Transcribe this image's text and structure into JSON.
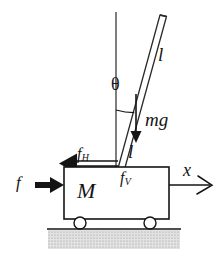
{
  "figure": {
    "background_color": "#ffffff",
    "ink_color": "#141414",
    "ground_fill_color": "#d4d4d4"
  },
  "labels": {
    "pendulum_length_upper": "l",
    "angle": "θ",
    "gravity_force": "mg",
    "pendulum_length_lower": "l",
    "horizontal_reaction_force": "f",
    "horizontal_reaction_force_subscript": "H",
    "applied_force": "f",
    "cart_mass": "M",
    "vertical_reaction_force": "f",
    "vertical_reaction_force_subscript": "V",
    "position_axis": "x"
  },
  "geometry": {
    "vertical_reference_line": {
      "x": 116,
      "y_top": 12,
      "y_bottom": 178
    },
    "pendulum_rod": {
      "pivot_x": 118,
      "pivot_y": 176,
      "tip_x": 163,
      "tip_y": 17,
      "width_px": 6,
      "tilt_degrees": 16
    },
    "angle_arc": {
      "center_x": 116,
      "center_y": 176,
      "radius": 66,
      "from_deg": 90,
      "to_deg": 74
    },
    "cart_box": {
      "x": 64,
      "y": 167,
      "width": 105,
      "height": 52
    },
    "wheels": [
      {
        "cx": 80,
        "cy": 223,
        "r": 6
      },
      {
        "cx": 150,
        "cy": 223,
        "r": 6
      }
    ],
    "ground": {
      "x": 48,
      "y": 228,
      "width": 132,
      "height": 20
    },
    "arrows": {
      "mg": {
        "x": 136,
        "y_from": 94,
        "y_to": 142,
        "direction": "down",
        "style": "thin"
      },
      "f_H": {
        "y": 163,
        "x_from": 118,
        "x_to": 60,
        "direction": "left",
        "style": "bold"
      },
      "f": {
        "y": 185,
        "x_from": 35,
        "x_to": 63,
        "direction": "right",
        "style": "bold"
      },
      "f_V": {
        "x": 116,
        "y_from": 167,
        "y_to": 207,
        "direction": "down",
        "style": "bold"
      },
      "x_axis": {
        "y": 185,
        "x_from": 169,
        "x_to": 212,
        "direction": "right",
        "style": "thin"
      }
    }
  }
}
